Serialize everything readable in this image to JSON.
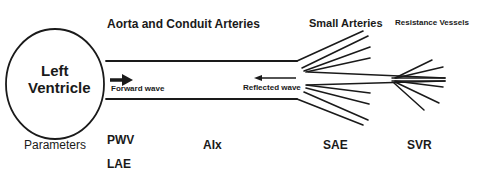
{
  "headers": {
    "aorta": "Aorta  and Conduit Arteries",
    "small_arteries": "Small Arteries",
    "resistance": "Resistance  Vessels"
  },
  "ventricle": {
    "line1": "Left",
    "line2": "Ventricle"
  },
  "waves": {
    "forward": "Forward wave",
    "reflected": "Reflected  wave"
  },
  "parameters": {
    "label": "Parameters",
    "items": [
      "PWV",
      "LAE",
      "AIx",
      "SAE",
      "SVR"
    ]
  },
  "colors": {
    "stroke": "#1a1a1a",
    "background": "#ffffff"
  }
}
